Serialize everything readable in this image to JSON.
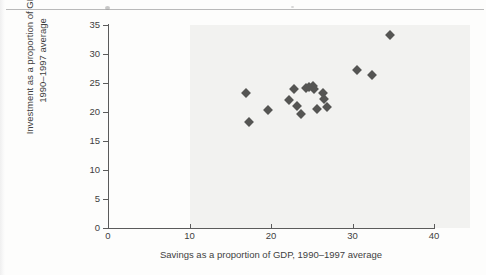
{
  "page": {
    "background_color": "#fdfdfc",
    "plot_shade_color": "#f2f2f0",
    "marker_color": "#555553",
    "axis_color": "#5b5b5b"
  },
  "chart_data": {
    "type": "scatter",
    "title": "",
    "xlabel": "Savings as a proportion of GDP, 1990–1997 average",
    "ylabel": "Investment as a proportion of GDP, 1990–1997 average",
    "ylabel_line1": "Investment as a proportion of GDP,",
    "ylabel_line2": "1990–1997 average",
    "xlim": [
      0,
      40
    ],
    "ylim": [
      0,
      35
    ],
    "xticks": [
      0,
      10,
      20,
      30,
      40
    ],
    "yticks": [
      0,
      5,
      10,
      15,
      20,
      25,
      30,
      35
    ],
    "xticklabels": [
      "0",
      "10",
      "20",
      "30",
      "40"
    ],
    "yticklabels": [
      "0",
      "5",
      "10",
      "15",
      "20",
      "25",
      "30",
      "35"
    ],
    "grid": false,
    "legend": "none",
    "marker": "diamond",
    "shaded_region_from_x": 10,
    "points": [
      {
        "x": 16.9,
        "y": 23.2
      },
      {
        "x": 17.3,
        "y": 18.2
      },
      {
        "x": 19.6,
        "y": 20.4
      },
      {
        "x": 22.2,
        "y": 22.1
      },
      {
        "x": 22.8,
        "y": 23.9
      },
      {
        "x": 23.2,
        "y": 21.0
      },
      {
        "x": 23.7,
        "y": 19.7
      },
      {
        "x": 24.3,
        "y": 24.2
      },
      {
        "x": 24.7,
        "y": 24.3
      },
      {
        "x": 25.1,
        "y": 24.5
      },
      {
        "x": 25.3,
        "y": 23.9
      },
      {
        "x": 25.6,
        "y": 20.5
      },
      {
        "x": 26.4,
        "y": 23.2
      },
      {
        "x": 26.5,
        "y": 22.3
      },
      {
        "x": 26.9,
        "y": 20.9
      },
      {
        "x": 30.5,
        "y": 27.2
      },
      {
        "x": 32.4,
        "y": 26.3
      },
      {
        "x": 34.6,
        "y": 33.3
      }
    ]
  }
}
